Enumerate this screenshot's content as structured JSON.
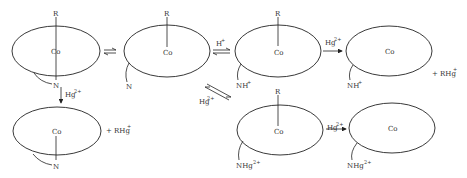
{
  "diagram": {
    "stroke_color": "#222222",
    "structures": [
      {
        "id": "s1",
        "center": "Co",
        "top": "R",
        "bottom": "N",
        "bottom_sup": "",
        "note": "base-on, N coordinated"
      },
      {
        "id": "s2",
        "center": "Co",
        "top": "R",
        "side": "N",
        "side_sup": "",
        "note": "base-off"
      },
      {
        "id": "s3",
        "center": "Co",
        "top": "R",
        "side": "NH",
        "side_sup": "+",
        "note": "protonated base-off"
      },
      {
        "id": "s4",
        "center": "Co",
        "top": "",
        "side": "NH",
        "side_sup": "+",
        "note": "dealkylated, protonated"
      },
      {
        "id": "s5",
        "center": "Co",
        "top": "",
        "bottom": "N",
        "bottom_sup": "",
        "note": "dealkylated, base-on"
      },
      {
        "id": "s6",
        "center": "Co",
        "top": "R",
        "side": "NHg",
        "side_sup": "2+",
        "note": "mercurated base"
      },
      {
        "id": "s7",
        "center": "Co",
        "top": "",
        "side": "NHg",
        "side_sup": "2+",
        "note": "dealkylated, mercurated"
      }
    ],
    "arrows": [
      {
        "from": "s1",
        "to": "s2",
        "type": "equilibrium",
        "label": "",
        "label_sup": ""
      },
      {
        "from": "s2",
        "to": "s3",
        "type": "equilibrium",
        "label": "H",
        "label_sup": "+"
      },
      {
        "from": "s3",
        "to": "s4",
        "type": "forward",
        "label": "Hg",
        "label_sup": "2+"
      },
      {
        "from": "s1",
        "to": "s5",
        "type": "forward",
        "label": "Hg",
        "label_sup": "2+"
      },
      {
        "from": "s3",
        "to": "s6",
        "type": "equilibrium",
        "label": "Hg",
        "label_sup": "2+"
      },
      {
        "from": "s6",
        "to": "s7",
        "type": "forward",
        "label": "Hg",
        "label_sup": "2+"
      }
    ],
    "products": [
      {
        "near": "s4",
        "text": "+ RHg",
        "sup": "+"
      },
      {
        "near": "s5",
        "text": "+ RHg",
        "sup": "+"
      }
    ],
    "labels": {
      "co": "Co",
      "r": "R",
      "n": "N",
      "nh": "NH",
      "nhg": "NHg",
      "plus": "+",
      "two_plus": "2+",
      "h": "H",
      "hg": "Hg",
      "rhg_plus": "+ RHg"
    }
  }
}
